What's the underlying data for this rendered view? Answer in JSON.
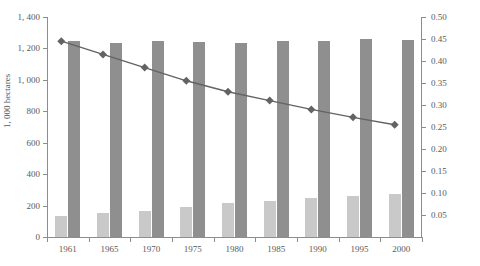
{
  "chart_data": {
    "type": "bar",
    "title": "",
    "subtitle": "",
    "xlabel": "",
    "ylabel": "1, 000 hectares",
    "y2label": "",
    "categories": [
      "1961",
      "1965",
      "1970",
      "1975",
      "1980",
      "1985",
      "1990",
      "1995",
      "2000"
    ],
    "ylim": [
      0,
      1400
    ],
    "y2lim": [
      0,
      0.5
    ],
    "ytick_labels": [
      "0",
      "200",
      "400",
      "600",
      "800",
      "1, 000",
      "1, 200",
      "1, 400"
    ],
    "ytick_values": [
      0,
      200,
      400,
      600,
      800,
      1000,
      1200,
      1400
    ],
    "y2tick_labels": [
      "0.05",
      "0.10",
      "0.15",
      "0.20",
      "0.25",
      "0.30",
      "0.35",
      "0.40",
      "0.45",
      "0.50"
    ],
    "y2tick_values": [
      0.05,
      0.1,
      0.15,
      0.2,
      0.25,
      0.3,
      0.35,
      0.4,
      0.45,
      0.5
    ],
    "grid": false,
    "legend": "none",
    "series": [
      {
        "name": "light-bar-series",
        "type": "bar",
        "axis": "left",
        "color": "#c9c9c9",
        "values": [
          135,
          150,
          165,
          190,
          215,
          232,
          248,
          262,
          272
        ]
      },
      {
        "name": "dark-bar-series",
        "type": "bar",
        "axis": "left",
        "color": "#8f8f8f",
        "values": [
          1245,
          1235,
          1245,
          1240,
          1235,
          1245,
          1250,
          1260,
          1255
        ]
      },
      {
        "name": "line-series",
        "type": "line",
        "axis": "right",
        "color": "#636363",
        "marker": "diamond",
        "values": [
          0.445,
          0.415,
          0.385,
          0.355,
          0.33,
          0.31,
          0.29,
          0.272,
          0.255
        ]
      }
    ]
  }
}
